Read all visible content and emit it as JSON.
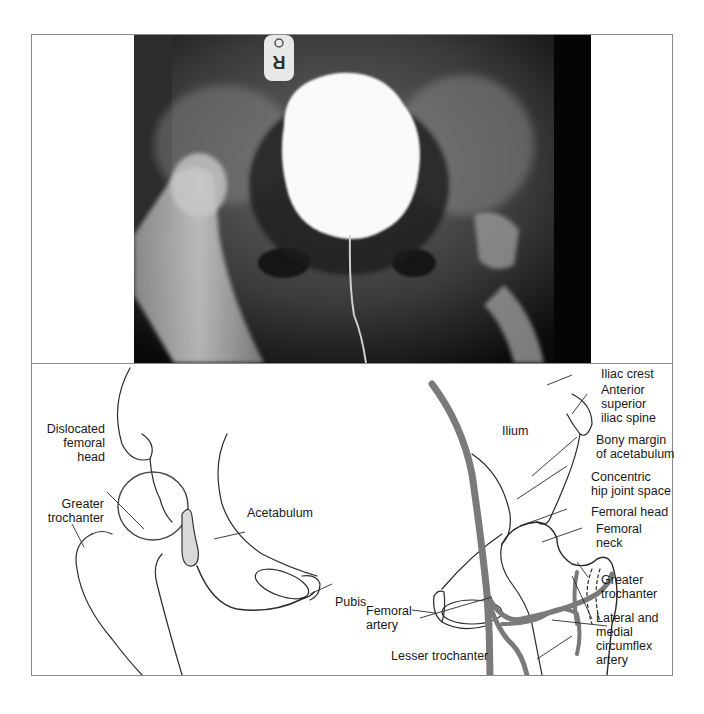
{
  "figure": {
    "xray": {
      "marker_text": "R",
      "description": "Pelvic radiograph with contrast-filled bladder and catheter"
    },
    "diagram": {
      "left_labels": {
        "dislocated_femoral_head": "Dislocated\nfemoral\nhead",
        "greater_trochanter": "Greater\ntrochanter",
        "acetabulum": "Acetabulum",
        "pubis": "Pubis"
      },
      "right_labels": {
        "iliac_crest": "Iliac crest",
        "anterior_superior_iliac_spine": "Anterior\nsuperior\niliac spine",
        "ilium": "Ilium",
        "bony_margin": "Bony margin\nof acetabulum",
        "concentric_space": "Concentric\nhip joint space",
        "femoral_head": "Femoral head",
        "femoral_neck": "Femoral\nneck",
        "greater_trochanter": "Greater\ntrochanter",
        "pubis": "Pubis",
        "femoral_artery": "Femoral\nartery",
        "circumflex_artery": "Lateral and\nmedial\ncircumflex\nartery",
        "lesser_trochanter": "Lesser trochanter"
      }
    },
    "colors": {
      "frame": "#8a8a8a",
      "artery": "#7a7a7a",
      "line": "#2a2a2a"
    }
  }
}
